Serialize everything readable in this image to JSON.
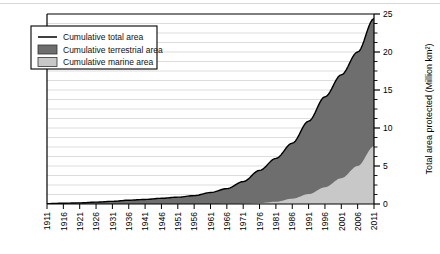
{
  "chart_data": {
    "type": "area",
    "title": "",
    "subtitle": "",
    "xlabel": "",
    "ylabel": "Total area protected (Million km²)",
    "xlim": [
      1911,
      2011
    ],
    "ylim": [
      0,
      25
    ],
    "grid": true,
    "legend_position": "top-left",
    "stacked": true,
    "y_ticks_major": [
      0,
      5,
      10,
      15,
      20,
      25
    ],
    "y_tick_labels": [
      "0",
      "5",
      "10",
      "15",
      "20",
      "25"
    ],
    "y_minor_step": 1.25,
    "x_tick_labels": [
      "1911",
      "1916",
      "1921",
      "1926",
      "1931",
      "1936",
      "1941",
      "1946",
      "1951",
      "1956",
      "1961",
      "1966",
      "1971",
      "1976",
      "1981",
      "1986",
      "1991",
      "1996",
      "2001",
      "2006",
      "2011"
    ],
    "x_tick_step": 5,
    "legend": [
      {
        "label": "Cumulative total area",
        "marker": "line",
        "color": "#000000"
      },
      {
        "label": "Cumulative terrestrial area",
        "marker": "swatch",
        "color": "#6e6e6e"
      },
      {
        "label": "Cumulative marine area",
        "marker": "swatch",
        "color": "#c8c8c8"
      }
    ],
    "series": [
      {
        "name": "Cumulative marine area",
        "color": "#c8c8c8",
        "stack_order": 0,
        "x": [
          1911,
          1916,
          1921,
          1926,
          1931,
          1936,
          1941,
          1946,
          1951,
          1956,
          1961,
          1966,
          1971,
          1976,
          1981,
          1986,
          1991,
          1996,
          2001,
          2006,
          2011
        ],
        "values": [
          0.0,
          0.0,
          0.0,
          0.0,
          0.0,
          0.0,
          0.0,
          0.0,
          0.0,
          0.0,
          0.01,
          0.02,
          0.05,
          0.12,
          0.3,
          0.7,
          1.3,
          2.2,
          3.4,
          5.0,
          7.6
        ]
      },
      {
        "name": "Cumulative terrestrial area",
        "color": "#6e6e6e",
        "stack_order": 1,
        "x": [
          1911,
          1916,
          1921,
          1926,
          1931,
          1936,
          1941,
          1946,
          1951,
          1956,
          1961,
          1966,
          1971,
          1976,
          1981,
          1986,
          1991,
          1996,
          2001,
          2006,
          2011
        ],
        "values": [
          0.05,
          0.1,
          0.15,
          0.25,
          0.35,
          0.5,
          0.6,
          0.75,
          0.9,
          1.1,
          1.5,
          2.0,
          2.9,
          4.3,
          5.7,
          7.3,
          9.6,
          11.9,
          13.6,
          15.0,
          16.8
        ]
      },
      {
        "name": "Cumulative total area",
        "color": "#000000",
        "stack_order": 2,
        "x": [
          1911,
          1916,
          1921,
          1926,
          1931,
          1936,
          1941,
          1946,
          1951,
          1956,
          1961,
          1966,
          1971,
          1976,
          1981,
          1986,
          1991,
          1996,
          2001,
          2006,
          2011
        ],
        "values": [
          0.05,
          0.1,
          0.15,
          0.25,
          0.35,
          0.5,
          0.6,
          0.75,
          0.9,
          1.1,
          1.51,
          2.02,
          2.95,
          4.42,
          6.0,
          8.0,
          10.9,
          14.1,
          17.0,
          20.0,
          24.4
        ]
      }
    ]
  }
}
